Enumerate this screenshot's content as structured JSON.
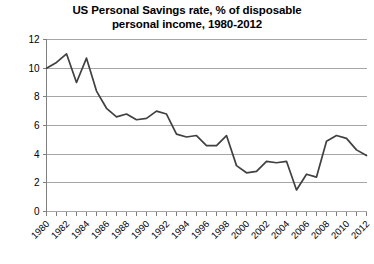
{
  "chart_data": {
    "type": "line",
    "title": "US Personal Savings rate, % of disposable\npersonal income, 1980-2012",
    "xlabel": "",
    "ylabel": "",
    "ylim": [
      0,
      12
    ],
    "xlim": [
      1980,
      2012
    ],
    "ytick_step": 2,
    "xtick_step": 2,
    "grid": true,
    "legend": "none",
    "line_color": "#404040",
    "grid_color": "#a6a6a6",
    "axis_color": "#808080",
    "ytick_labels": [
      "0",
      "2",
      "4",
      "6",
      "8",
      "10",
      "12"
    ],
    "ytick_values": [
      0,
      2,
      4,
      6,
      8,
      10,
      12
    ],
    "xtick_labels": [
      "1980",
      "1982",
      "1984",
      "1986",
      "1988",
      "1990",
      "1992",
      "1994",
      "1996",
      "1998",
      "2000",
      "2002",
      "2004",
      "2006",
      "2008",
      "2010",
      "2012"
    ],
    "xtick_values": [
      1980,
      1982,
      1984,
      1986,
      1988,
      1990,
      1992,
      1994,
      1996,
      1998,
      2000,
      2002,
      2004,
      2006,
      2008,
      2010,
      2012
    ],
    "x": [
      1980,
      1981,
      1982,
      1983,
      1984,
      1985,
      1986,
      1987,
      1988,
      1989,
      1990,
      1991,
      1992,
      1993,
      1994,
      1995,
      1996,
      1997,
      1998,
      1999,
      2000,
      2001,
      2002,
      2003,
      2004,
      2005,
      2006,
      2007,
      2008,
      2009,
      2010,
      2011,
      2012
    ],
    "values": [
      10.0,
      10.4,
      11.0,
      9.0,
      10.7,
      8.4,
      7.2,
      6.6,
      6.8,
      6.4,
      6.5,
      7.0,
      6.8,
      5.4,
      5.2,
      5.3,
      4.6,
      4.6,
      5.3,
      3.2,
      2.7,
      2.8,
      3.5,
      3.4,
      3.5,
      1.5,
      2.6,
      2.4,
      4.9,
      5.3,
      5.1,
      4.3,
      3.9
    ],
    "series_name": "US Personal Savings rate"
  }
}
